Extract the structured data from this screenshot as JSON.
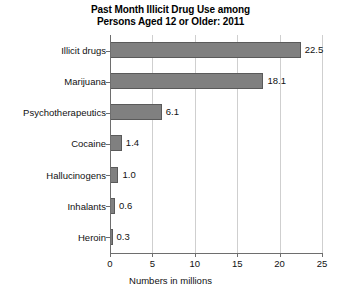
{
  "chart_data": {
    "type": "bar",
    "orientation": "horizontal",
    "title": "Past Month Illicit Drug Use among Persons Aged 12 or Older: 2011",
    "title_lines": [
      "Past Month Illicit Drug Use among",
      "Persons Aged 12 or Older: 2011"
    ],
    "categories": [
      "Illicit drugs",
      "Marijuana",
      "Psychotherapeutics",
      "Cocaine",
      "Hallucinogens",
      "Inhalants",
      "Heroin"
    ],
    "values": [
      22.5,
      18.1,
      6.1,
      1.4,
      1.0,
      0.6,
      0.3
    ],
    "value_labels": [
      "22.5",
      "18.1",
      "6.1",
      "1.4",
      "1.0",
      "0.6",
      "0.3"
    ],
    "xlabel": "Numbers in millions",
    "ylabel": "",
    "xlim": [
      0,
      25
    ],
    "xticks": [
      0,
      5,
      10,
      15,
      20,
      25
    ],
    "xtick_labels": [
      "0",
      "5",
      "10",
      "15",
      "20",
      "25"
    ],
    "grid": "vertical",
    "legend": "none",
    "bar_color": "#808080",
    "bar_border_color": "#5a5a5a",
    "gridline_color": "#cfcfcf",
    "axis_color": "#6e6e6e",
    "background_color": "#ffffff"
  }
}
